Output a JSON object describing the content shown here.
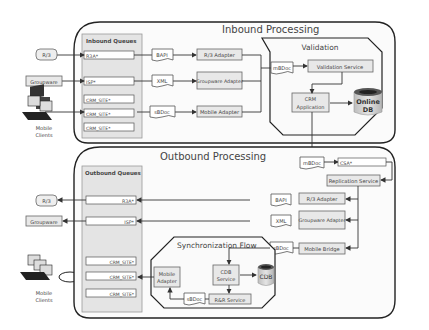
{
  "inbound": {
    "title": "Inbound Processing",
    "queues_title": "Inbound Queues",
    "queues": [
      "R3A*",
      "ISP*",
      "CRM_SITE*",
      "CRM_SITE*",
      "CRM_SITE*"
    ],
    "docs": [
      "BAPI",
      "XML",
      "sBDoc"
    ],
    "adapters": [
      "R/3 Adapter",
      "Groupware Adapter",
      "Mobile Adapter"
    ],
    "mbdoc": "mBDoc"
  },
  "validation": {
    "title": "Validation",
    "service": "Validation Service",
    "crm_app_line1": "CRM",
    "crm_app_line2": "Application",
    "db_line1": "Online",
    "db_line2": "DB"
  },
  "outbound": {
    "title": "Outbound Processing",
    "queues_title": "Outbound Queues",
    "queues": [
      "R3A*",
      "ISP*",
      "CRM_SITE*",
      "CRM_SITE*",
      "CRM_SITE*"
    ],
    "mbdoc": "mBDoc",
    "csa": "CSA*",
    "replication": "Replication Service",
    "docs": [
      "BAPI",
      "XML",
      "sBDoc"
    ],
    "adapters": [
      "R/3 Adapter",
      "Groupware Adapter",
      "Mobile Bridge"
    ]
  },
  "sync": {
    "title": "Synchronization Flow",
    "mobile_adapter_line1": "Mobile",
    "mobile_adapter_line2": "Adapter",
    "cdb_service_line1": "CDB",
    "cdb_service_line2": "Service",
    "cdb": "CDB",
    "sbdoc": "sBDoc",
    "rr_service": "R&R Service"
  },
  "external": {
    "r3": "R/3",
    "groupware": "Groupware",
    "mobile_line1": "Mobile",
    "mobile_line2": "Clients"
  },
  "icons": {
    "laptop": "laptop-stack-icon",
    "database": "database-cylinder-icon",
    "document": "document-wave-icon"
  }
}
